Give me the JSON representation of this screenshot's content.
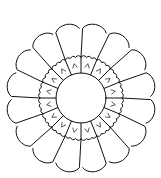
{
  "figure": {
    "petal_count": 16,
    "colors": {
      "stroke": "#111111",
      "background": "#ffffff"
    },
    "geometry": {
      "center": [
        81,
        98
      ],
      "outer_radius": 75,
      "band_outer_radius": 41,
      "center_radius": 25
    }
  }
}
